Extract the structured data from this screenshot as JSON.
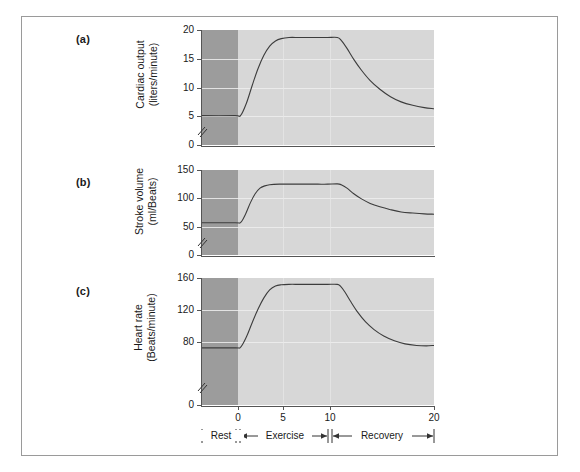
{
  "figure": {
    "panel_letters": [
      "(a)",
      "(b)",
      "(c)"
    ]
  },
  "chart_data": [
    {
      "type": "line",
      "panel": "(a)",
      "title": "",
      "ylabel_line1": "Cardiac output",
      "ylabel_line2": "(liters/minute)",
      "xlabel": "",
      "ylim": [
        0,
        20
      ],
      "yticks": [
        0,
        5,
        10,
        15,
        20
      ],
      "yticklabels": [
        "0",
        "5",
        "10",
        "15",
        "20"
      ],
      "y_axis_break": true,
      "xlim": [
        -4,
        20
      ],
      "xticks": [
        0,
        5,
        10,
        20
      ],
      "xticklabels": [
        "0",
        "5",
        "10",
        "20"
      ],
      "grid": "horizontal",
      "rest_value": 5.1,
      "exercise_plateau": 18.7,
      "recovery_value": 6.3,
      "x": [
        -4,
        -0.6,
        0,
        0.6,
        1.2,
        1.8,
        2.4,
        3.0,
        3.6,
        4.2,
        5.0,
        6.0,
        7.0,
        8.0,
        9.0,
        10.0,
        10.4,
        11.0,
        11.7,
        12.5,
        13.4,
        14.4,
        15.5,
        16.6,
        17.8,
        19.0,
        20.0
      ],
      "y": [
        5.1,
        5.1,
        5.15,
        7.3,
        10.4,
        13.3,
        15.6,
        17.2,
        18.1,
        18.5,
        18.7,
        18.7,
        18.7,
        18.7,
        18.7,
        18.7,
        18.2,
        16.8,
        14.9,
        13.0,
        11.2,
        9.7,
        8.4,
        7.5,
        6.9,
        6.5,
        6.3
      ]
    },
    {
      "type": "line",
      "panel": "(b)",
      "title": "",
      "ylabel_line1": "Stroke volume",
      "ylabel_line2": "(ml/Beats)",
      "xlabel": "",
      "ylim": [
        0,
        150
      ],
      "yticks": [
        0,
        50,
        100,
        150
      ],
      "yticklabels": [
        "0",
        "50",
        "100",
        "150"
      ],
      "y_axis_break": true,
      "xlim": [
        -4,
        20
      ],
      "xticks": [
        0,
        5,
        10,
        20
      ],
      "xticklabels": [
        "0",
        "5",
        "10",
        "20"
      ],
      "grid": "horizontal",
      "rest_value": 57,
      "exercise_plateau": 125,
      "recovery_value": 72,
      "x": [
        -4,
        -0.6,
        0,
        0.5,
        1.0,
        1.5,
        2.0,
        2.5,
        3.0,
        4.0,
        5.0,
        6.0,
        7.0,
        8.0,
        9.0,
        10.0,
        10.4,
        11.0,
        11.7,
        12.5,
        13.4,
        14.4,
        15.5,
        16.6,
        17.8,
        19.0,
        20.0
      ],
      "y": [
        57,
        57,
        57.5,
        72,
        92,
        108,
        118,
        122,
        124,
        125,
        125,
        125,
        125,
        125,
        125,
        125.5,
        124,
        118,
        108,
        99,
        91,
        85,
        80,
        76,
        74,
        72.5,
        72
      ]
    },
    {
      "type": "line",
      "panel": "(c)",
      "title": "",
      "ylabel_line1": "Heart rate",
      "ylabel_line2": "(Beats/minute)",
      "xlabel": "",
      "ylim": [
        0,
        160
      ],
      "yticks": [
        0,
        80,
        120,
        160
      ],
      "yticklabels": [
        "0",
        "80",
        "120",
        "160"
      ],
      "y_axis_break": true,
      "xlim": [
        -4,
        20
      ],
      "xticks": [
        0,
        5,
        10,
        20
      ],
      "xticklabels": [
        "0",
        "5",
        "10",
        "20"
      ],
      "grid": "horizontal",
      "rest_value": 72,
      "exercise_plateau": 152,
      "recovery_value": 75,
      "x": [
        -4,
        -0.6,
        0,
        0.6,
        1.2,
        1.8,
        2.4,
        3.0,
        3.6,
        4.2,
        5.0,
        6.0,
        7.0,
        8.0,
        9.0,
        10.0,
        10.3,
        10.8,
        11.4,
        12.1,
        12.9,
        13.8,
        14.8,
        15.9,
        17.0,
        18.2,
        19.2,
        20.0
      ],
      "y": [
        72,
        72,
        73,
        86,
        104,
        121,
        135,
        145,
        150,
        151.5,
        152,
        152,
        152,
        152,
        152,
        152,
        150,
        142,
        130,
        117,
        105,
        95,
        87,
        81,
        77,
        75,
        74.5,
        75
      ]
    }
  ],
  "phase_axis": {
    "phases": [
      {
        "label": "Rest",
        "start": -4,
        "end": 0
      },
      {
        "label": "Exercise",
        "start": 0,
        "end": 10
      },
      {
        "label": "Recovery",
        "start": 10,
        "end": 20
      }
    ]
  }
}
